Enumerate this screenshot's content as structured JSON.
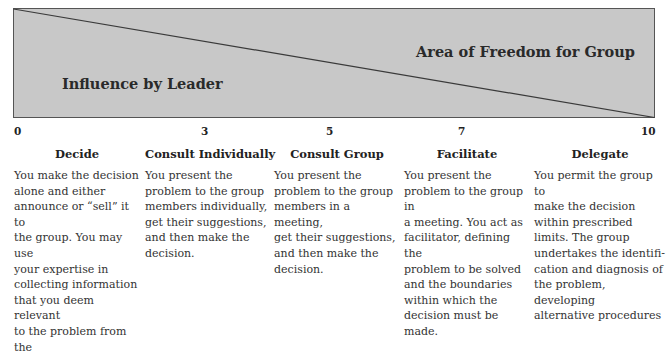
{
  "diagram": {
    "region_labels": {
      "leader": "Influence by Leader",
      "group": "Area of Freedom for Group"
    },
    "colors": {
      "fill": "#c8c8c8",
      "border": "#555555",
      "diagonal": "#3a3a3a"
    },
    "scale": {
      "ticks": [
        "0",
        "3",
        "5",
        "7",
        "10"
      ]
    },
    "styles": [
      {
        "title": "Decide",
        "text": "You make the decision\nalone and either\nannounce or “sell” it to\nthe group. You may use\nyour expertise in\ncollecting information\nthat you deem relevant\nto the problem from the"
      },
      {
        "title": "Consult Individually",
        "text": "You present the\nproblem to the group\nmembers individually,\nget their suggestions,\nand then make the\ndecision."
      },
      {
        "title": "Consult Group",
        "text": "You present the\nproblem to the group\nmembers in a meeting,\nget their suggestions,\nand then make the\ndecision."
      },
      {
        "title": "Facilitate",
        "text": "You present the\nproblem to the group in\na meeting. You act as\nfacilitator, defining the\nproblem to be solved\nand the boundaries\nwithin which the\ndecision must be made."
      },
      {
        "title": "Delegate",
        "text": "You permit the group to\nmake the decision\nwithin prescribed\nlimits. The group\nundertakes the identifi-\ncation and diagnosis of\nthe problem, developing\nalternative procedures"
      }
    ]
  }
}
